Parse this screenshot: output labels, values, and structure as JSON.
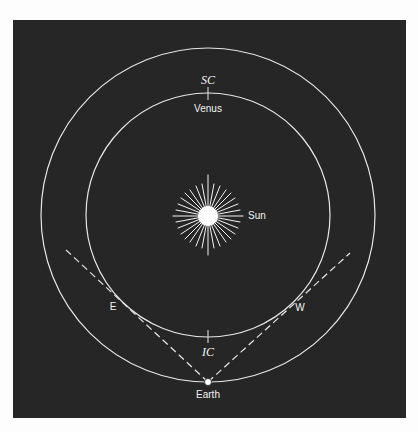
{
  "diagram": {
    "background_color": "#262626",
    "line_color": "#e8e8e8",
    "center": {
      "x": 208,
      "y": 215
    },
    "orbits": {
      "venus_orbit_radius": 122,
      "earth_orbit_radius": 167
    },
    "labels": {
      "superior_conjunction": "SC",
      "inferior_conjunction": "IC",
      "venus": "Venus",
      "sun": "Sun",
      "earth": "Earth",
      "east_elongation": "E",
      "west_elongation": "W"
    }
  }
}
